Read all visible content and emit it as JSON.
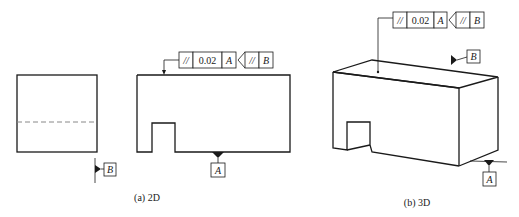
{
  "figure": {
    "panels": [
      {
        "id": "2d",
        "caption": "(a) 2D",
        "feature_control_frame": {
          "symbol": "//",
          "tolerance": "0.02",
          "datum": "A",
          "attached_frame": {
            "symbol": "//",
            "datum": "B"
          }
        },
        "datum_labels": [
          "A",
          "B"
        ]
      },
      {
        "id": "3d",
        "caption": "(b) 3D",
        "feature_control_frame": {
          "symbol": "//",
          "tolerance": "0.02",
          "datum": "A",
          "attached_frame": {
            "symbol": "//",
            "datum": "B"
          }
        },
        "datum_labels": [
          "B",
          "A"
        ]
      }
    ]
  }
}
